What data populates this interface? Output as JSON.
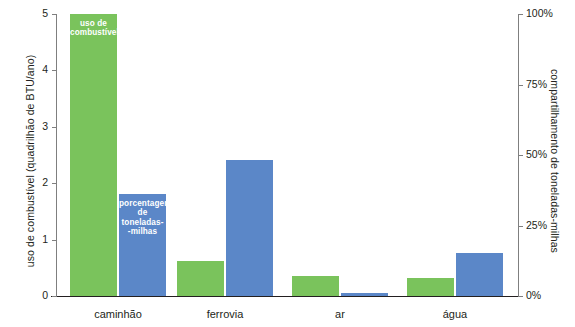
{
  "chart_data": {
    "type": "bar",
    "title": "",
    "categories": [
      "caminhão",
      "ferrovia",
      "ar",
      "água"
    ],
    "series": [
      {
        "name": "uso de combustível",
        "axis": "left",
        "color": "#7ac35c",
        "values": [
          5.0,
          0.62,
          0.36,
          0.32
        ]
      },
      {
        "name": "porcentagem de toneladas--milhas",
        "axis": "right",
        "color": "#5b87c8",
        "values_percent": [
          36,
          48,
          1,
          15
        ],
        "values": [
          1.81,
          2.41,
          0.05,
          0.76
        ]
      }
    ],
    "ylabel": "uso de combustível (quadrilhão de BTU/ano)",
    "ylabel_right": "compartilhamento de toneladas-milhas",
    "xlabel": "",
    "ylim": [
      0,
      5
    ],
    "ylim_right": [
      0,
      100
    ],
    "yticks": [
      "0",
      "1",
      "2",
      "3",
      "4",
      "5"
    ],
    "yticks_right": [
      "0%",
      "25%",
      "50%",
      "75%",
      "100%"
    ],
    "grid": false,
    "legend_position": "in-bar-annotations"
  },
  "axes": {
    "left_title": "uso de combustível (quadrilhão de BTU/ano)",
    "right_title": "compartilhamento de toneladas-milhas",
    "left_ticks": [
      {
        "label": "5",
        "value": 5
      },
      {
        "label": "4",
        "value": 4
      },
      {
        "label": "3",
        "value": 3
      },
      {
        "label": "2",
        "value": 2
      },
      {
        "label": "1",
        "value": 1
      },
      {
        "label": "0",
        "value": 0
      }
    ],
    "right_ticks": [
      {
        "label": "100%",
        "value": 100
      },
      {
        "label": "75%",
        "value": 75
      },
      {
        "label": "50%",
        "value": 50
      },
      {
        "label": "25%",
        "value": 25
      },
      {
        "label": "0%",
        "value": 0
      }
    ]
  },
  "categories": [
    {
      "label": "caminhão"
    },
    {
      "label": "ferrovia"
    },
    {
      "label": "ar"
    },
    {
      "label": "água"
    }
  ],
  "annotations": {
    "fuel_label_line1": "uso de",
    "fuel_label_line2": "combustível",
    "share_label_line1": "porcentagem",
    "share_label_line2": "de",
    "share_label_line3": "toneladas-",
    "share_label_line4": "-milhas"
  },
  "colors": {
    "fuel": "#7ac35c",
    "share": "#5b87c8",
    "axis": "#7f7f7f",
    "text": "#231f20"
  }
}
